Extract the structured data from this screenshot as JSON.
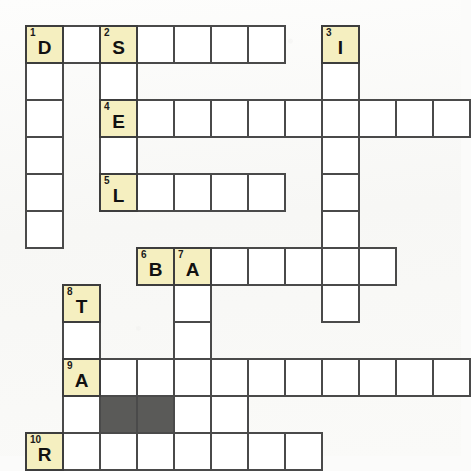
{
  "puzzle": {
    "title": "Crossword Puzzle Grid",
    "cell_size": 37,
    "origin_x": 25,
    "origin_y": 25,
    "columns": 12,
    "rows": 11,
    "colors": {
      "numbered_cell_fill": "#f5efc0",
      "empty_cell_fill": "#ffffff",
      "blocked_cell_fill": "#5a5a58",
      "grid_line": "#4a4a4a",
      "page_background": "#fbfbfa",
      "text": "#111111"
    }
  },
  "cells": [
    {
      "name": "cell-r0c0",
      "col": 0,
      "row": 0,
      "number": "1",
      "letter": "D",
      "state": "numbered"
    },
    {
      "name": "cell-r0c1",
      "col": 1,
      "row": 0,
      "number": "",
      "letter": "",
      "state": "empty"
    },
    {
      "name": "cell-r0c2",
      "col": 2,
      "row": 0,
      "number": "2",
      "letter": "S",
      "state": "numbered"
    },
    {
      "name": "cell-r0c3",
      "col": 3,
      "row": 0,
      "number": "",
      "letter": "",
      "state": "empty"
    },
    {
      "name": "cell-r0c4",
      "col": 4,
      "row": 0,
      "number": "",
      "letter": "",
      "state": "empty"
    },
    {
      "name": "cell-r0c5",
      "col": 5,
      "row": 0,
      "number": "",
      "letter": "",
      "state": "empty"
    },
    {
      "name": "cell-r0c6",
      "col": 6,
      "row": 0,
      "number": "",
      "letter": "",
      "state": "empty"
    },
    {
      "name": "cell-r0c8",
      "col": 8,
      "row": 0,
      "number": "3",
      "letter": "I",
      "state": "numbered"
    },
    {
      "name": "cell-r1c0",
      "col": 0,
      "row": 1,
      "number": "",
      "letter": "",
      "state": "empty"
    },
    {
      "name": "cell-r1c2",
      "col": 2,
      "row": 1,
      "number": "",
      "letter": "",
      "state": "empty"
    },
    {
      "name": "cell-r1c8",
      "col": 8,
      "row": 1,
      "number": "",
      "letter": "",
      "state": "empty"
    },
    {
      "name": "cell-r2c0",
      "col": 0,
      "row": 2,
      "number": "",
      "letter": "",
      "state": "empty"
    },
    {
      "name": "cell-r2c2",
      "col": 2,
      "row": 2,
      "number": "4",
      "letter": "E",
      "state": "numbered"
    },
    {
      "name": "cell-r2c3",
      "col": 3,
      "row": 2,
      "number": "",
      "letter": "",
      "state": "empty"
    },
    {
      "name": "cell-r2c4",
      "col": 4,
      "row": 2,
      "number": "",
      "letter": "",
      "state": "empty"
    },
    {
      "name": "cell-r2c5",
      "col": 5,
      "row": 2,
      "number": "",
      "letter": "",
      "state": "empty"
    },
    {
      "name": "cell-r2c6",
      "col": 6,
      "row": 2,
      "number": "",
      "letter": "",
      "state": "empty"
    },
    {
      "name": "cell-r2c7",
      "col": 7,
      "row": 2,
      "number": "",
      "letter": "",
      "state": "empty"
    },
    {
      "name": "cell-r2c8",
      "col": 8,
      "row": 2,
      "number": "",
      "letter": "",
      "state": "empty"
    },
    {
      "name": "cell-r2c9",
      "col": 9,
      "row": 2,
      "number": "",
      "letter": "",
      "state": "empty"
    },
    {
      "name": "cell-r2c10",
      "col": 10,
      "row": 2,
      "number": "",
      "letter": "",
      "state": "empty"
    },
    {
      "name": "cell-r2c11",
      "col": 11,
      "row": 2,
      "number": "",
      "letter": "",
      "state": "empty"
    },
    {
      "name": "cell-r3c0",
      "col": 0,
      "row": 3,
      "number": "",
      "letter": "",
      "state": "empty"
    },
    {
      "name": "cell-r3c2",
      "col": 2,
      "row": 3,
      "number": "",
      "letter": "",
      "state": "empty"
    },
    {
      "name": "cell-r3c8",
      "col": 8,
      "row": 3,
      "number": "",
      "letter": "",
      "state": "empty"
    },
    {
      "name": "cell-r4c0",
      "col": 0,
      "row": 4,
      "number": "",
      "letter": "",
      "state": "empty"
    },
    {
      "name": "cell-r4c2",
      "col": 2,
      "row": 4,
      "number": "5",
      "letter": "L",
      "state": "numbered"
    },
    {
      "name": "cell-r4c3",
      "col": 3,
      "row": 4,
      "number": "",
      "letter": "",
      "state": "empty"
    },
    {
      "name": "cell-r4c4",
      "col": 4,
      "row": 4,
      "number": "",
      "letter": "",
      "state": "empty"
    },
    {
      "name": "cell-r4c5",
      "col": 5,
      "row": 4,
      "number": "",
      "letter": "",
      "state": "empty"
    },
    {
      "name": "cell-r4c6",
      "col": 6,
      "row": 4,
      "number": "",
      "letter": "",
      "state": "empty"
    },
    {
      "name": "cell-r4c8",
      "col": 8,
      "row": 4,
      "number": "",
      "letter": "",
      "state": "empty"
    },
    {
      "name": "cell-r5c0",
      "col": 0,
      "row": 5,
      "number": "",
      "letter": "",
      "state": "empty"
    },
    {
      "name": "cell-r5c8",
      "col": 8,
      "row": 5,
      "number": "",
      "letter": "",
      "state": "empty"
    },
    {
      "name": "cell-r6c3",
      "col": 3,
      "row": 6,
      "number": "6",
      "letter": "B",
      "state": "numbered"
    },
    {
      "name": "cell-r6c4",
      "col": 4,
      "row": 6,
      "number": "7",
      "letter": "A",
      "state": "numbered"
    },
    {
      "name": "cell-r6c5",
      "col": 5,
      "row": 6,
      "number": "",
      "letter": "",
      "state": "empty"
    },
    {
      "name": "cell-r6c6",
      "col": 6,
      "row": 6,
      "number": "",
      "letter": "",
      "state": "empty"
    },
    {
      "name": "cell-r6c7",
      "col": 7,
      "row": 6,
      "number": "",
      "letter": "",
      "state": "empty"
    },
    {
      "name": "cell-r6c8",
      "col": 8,
      "row": 6,
      "number": "",
      "letter": "",
      "state": "empty"
    },
    {
      "name": "cell-r6c9",
      "col": 9,
      "row": 6,
      "number": "",
      "letter": "",
      "state": "empty"
    },
    {
      "name": "cell-r7c1",
      "col": 1,
      "row": 7,
      "number": "8",
      "letter": "T",
      "state": "numbered"
    },
    {
      "name": "cell-r7c4",
      "col": 4,
      "row": 7,
      "number": "",
      "letter": "",
      "state": "empty"
    },
    {
      "name": "cell-r7c8",
      "col": 8,
      "row": 7,
      "number": "",
      "letter": "",
      "state": "empty"
    },
    {
      "name": "cell-r8c1",
      "col": 1,
      "row": 8,
      "number": "",
      "letter": "",
      "state": "empty"
    },
    {
      "name": "cell-r8c4",
      "col": 4,
      "row": 8,
      "number": "",
      "letter": "",
      "state": "empty"
    },
    {
      "name": "cell-r9c1",
      "col": 1,
      "row": 9,
      "number": "9",
      "letter": "A",
      "state": "numbered"
    },
    {
      "name": "cell-r9c2",
      "col": 2,
      "row": 9,
      "number": "",
      "letter": "",
      "state": "empty"
    },
    {
      "name": "cell-r9c3",
      "col": 3,
      "row": 9,
      "number": "",
      "letter": "",
      "state": "empty"
    },
    {
      "name": "cell-r9c4",
      "col": 4,
      "row": 9,
      "number": "",
      "letter": "",
      "state": "empty"
    },
    {
      "name": "cell-r9c5",
      "col": 5,
      "row": 9,
      "number": "",
      "letter": "",
      "state": "empty"
    },
    {
      "name": "cell-r9c6",
      "col": 6,
      "row": 9,
      "number": "",
      "letter": "",
      "state": "empty"
    },
    {
      "name": "cell-r9c7",
      "col": 7,
      "row": 9,
      "number": "",
      "letter": "",
      "state": "empty"
    },
    {
      "name": "cell-r9c8",
      "col": 8,
      "row": 9,
      "number": "",
      "letter": "",
      "state": "empty"
    },
    {
      "name": "cell-r9c9",
      "col": 9,
      "row": 9,
      "number": "",
      "letter": "",
      "state": "empty"
    },
    {
      "name": "cell-r9c10",
      "col": 10,
      "row": 9,
      "number": "",
      "letter": "",
      "state": "empty"
    },
    {
      "name": "cell-r9c11",
      "col": 11,
      "row": 9,
      "number": "",
      "letter": "",
      "state": "empty"
    },
    {
      "name": "cell-r10c1",
      "col": 1,
      "row": 10,
      "number": "",
      "letter": "",
      "state": "empty"
    },
    {
      "name": "cell-r10c2",
      "col": 2,
      "row": 10,
      "number": "",
      "letter": "",
      "state": "blocked"
    },
    {
      "name": "cell-r10c3",
      "col": 3,
      "row": 10,
      "number": "",
      "letter": "",
      "state": "blocked"
    },
    {
      "name": "cell-r10c4",
      "col": 4,
      "row": 10,
      "number": "",
      "letter": "",
      "state": "empty"
    },
    {
      "name": "cell-r10c5",
      "col": 5,
      "row": 10,
      "number": "",
      "letter": "",
      "state": "empty"
    },
    {
      "name": "cell-r11c0",
      "col": 0,
      "row": 11,
      "number": "10",
      "letter": "R",
      "state": "numbered"
    },
    {
      "name": "cell-r11c1",
      "col": 1,
      "row": 11,
      "number": "",
      "letter": "",
      "state": "empty"
    },
    {
      "name": "cell-r11c2",
      "col": 2,
      "row": 11,
      "number": "",
      "letter": "",
      "state": "empty"
    },
    {
      "name": "cell-r11c3",
      "col": 3,
      "row": 11,
      "number": "",
      "letter": "",
      "state": "empty"
    },
    {
      "name": "cell-r11c4",
      "col": 4,
      "row": 11,
      "number": "",
      "letter": "",
      "state": "empty"
    },
    {
      "name": "cell-r11c5",
      "col": 5,
      "row": 11,
      "number": "",
      "letter": "",
      "state": "empty"
    },
    {
      "name": "cell-r11c6",
      "col": 6,
      "row": 11,
      "number": "",
      "letter": "",
      "state": "empty"
    },
    {
      "name": "cell-r11c7",
      "col": 7,
      "row": 11,
      "number": "",
      "letter": "",
      "state": "empty"
    }
  ]
}
